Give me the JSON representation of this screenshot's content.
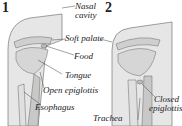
{
  "diagram": {
    "panels": [
      {
        "number": "1",
        "state": "swallowing open"
      },
      {
        "number": "2",
        "state": "closed"
      }
    ],
    "labels": {
      "nasal_cavity_line1": "Nasal",
      "nasal_cavity_line2": "cavity",
      "soft_palate": "Soft palate",
      "food": "Food",
      "tongue": "Tongue",
      "open_epiglottis": "Open epiglottis",
      "esophagus": "Esophagus",
      "closed_epiglottis_line1": "Closed",
      "closed_epiglottis_line2": "epiglottis",
      "trachea": "Trachea"
    },
    "colors": {
      "tissue": "#d9d9d9",
      "outline": "#555555",
      "text": "#222222"
    }
  }
}
